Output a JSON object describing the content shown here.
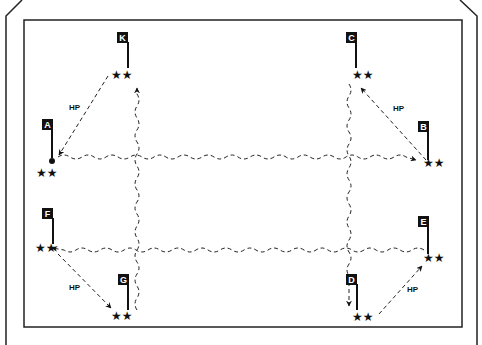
{
  "diagram": {
    "type": "formation-drill-diagram",
    "frame_color": "#222222",
    "background": "#ffffff",
    "stations": [
      {
        "id": "A",
        "label": "A",
        "flag": [
          52,
          150,
          52,
          115
        ],
        "stars": [
          48,
          172
        ]
      },
      {
        "id": "B",
        "label": "B",
        "flag": [
          428,
          160,
          428,
          125
        ],
        "stars": [
          434,
          163
        ]
      },
      {
        "id": "C",
        "label": "C",
        "flag": [
          356,
          70,
          356,
          35
        ],
        "stars": [
          364,
          74
        ]
      },
      {
        "id": "D",
        "label": "D",
        "flag": [
          357,
          316,
          357,
          280
        ],
        "stars": [
          364,
          316
        ]
      },
      {
        "id": "E",
        "label": "E",
        "flag": [
          428,
          255,
          428,
          220
        ],
        "stars": [
          434,
          258
        ]
      },
      {
        "id": "F",
        "label": "F",
        "flag": [
          53,
          248,
          53,
          212
        ],
        "stars": [
          47,
          248
        ]
      },
      {
        "id": "G",
        "label": "G",
        "flag": [
          128,
          315,
          128,
          280
        ],
        "stars": [
          121,
          315
        ]
      },
      {
        "id": "K",
        "label": "K",
        "flag": [
          128,
          70,
          128,
          35
        ],
        "stars": [
          121,
          74
        ]
      }
    ],
    "annotations": [
      {
        "text": "HP",
        "x": 73,
        "y": 108
      },
      {
        "text": "HP",
        "x": 396,
        "y": 110
      },
      {
        "text": "HP",
        "x": 70,
        "y": 289
      },
      {
        "text": "HP",
        "x": 408,
        "y": 290
      }
    ],
    "hp_label": "HP"
  }
}
